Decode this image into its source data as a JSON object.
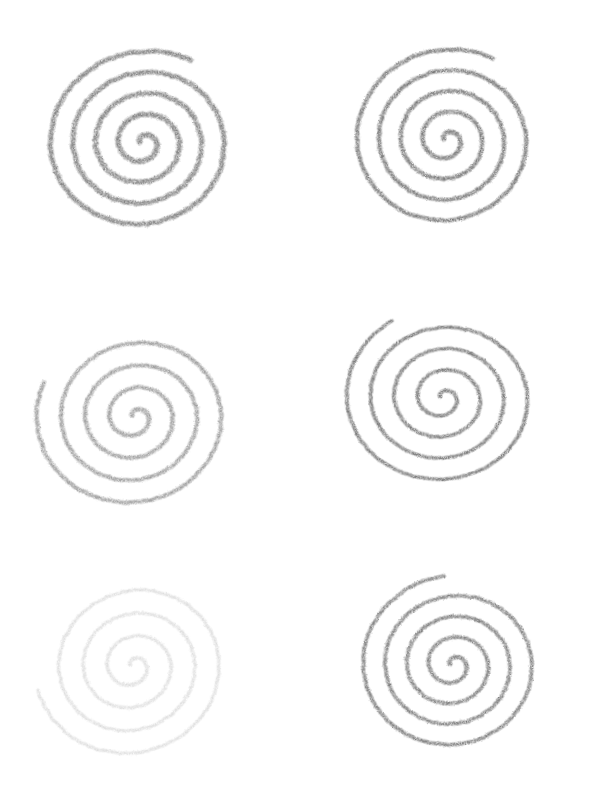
{
  "canvas": {
    "width": 589,
    "height": 805,
    "background": "#ffffff"
  },
  "spirals": [
    {
      "id": "top-left",
      "cx": 143,
      "cy": 143,
      "r": 100,
      "turns": 4.3,
      "start": 200,
      "color": "#6e6e6e",
      "opacity": 0.9,
      "width": 6.5,
      "rough": 1.6,
      "squash": 0.93,
      "rot": -10
    },
    {
      "id": "top-right",
      "cx": 447,
      "cy": 140,
      "r": 97,
      "turns": 4.3,
      "start": 195,
      "color": "#6a6a6a",
      "opacity": 0.95,
      "width": 5.5,
      "rough": 1.2,
      "squash": 0.95,
      "rot": -5
    },
    {
      "id": "middle-left",
      "cx": 135,
      "cy": 417,
      "r": 100,
      "turns": 4.0,
      "start": 215,
      "color": "#8a8a8a",
      "opacity": 0.85,
      "width": 5.5,
      "rough": 1.3,
      "squash": 0.92,
      "rot": -12
    },
    {
      "id": "middle-right",
      "cx": 443,
      "cy": 398,
      "r": 100,
      "turns": 4.1,
      "start": 205,
      "color": "#6c6c6c",
      "opacity": 0.95,
      "width": 5.0,
      "rough": 1.0,
      "squash": 0.9,
      "rot": -2
    },
    {
      "id": "bottom-left",
      "cx": 133,
      "cy": 666,
      "r": 98,
      "turns": 3.9,
      "start": 220,
      "color": "#d4d4d4",
      "opacity": 0.75,
      "width": 4.5,
      "rough": 1.4,
      "squash": 0.93,
      "rot": -18
    },
    {
      "id": "bottom-right",
      "cx": 453,
      "cy": 665,
      "r": 95,
      "turns": 4.2,
      "start": 200,
      "color": "#707070",
      "opacity": 0.95,
      "width": 5.0,
      "rough": 1.1,
      "squash": 0.94,
      "rot": -8
    }
  ]
}
